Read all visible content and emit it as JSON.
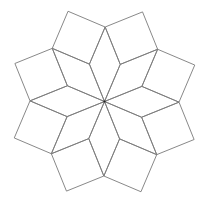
{
  "diagram": {
    "type": "eight-pointed-star-rhombus-tiling",
    "canvas": {
      "width": 208,
      "height": 202,
      "background": "#ffffff"
    },
    "center": {
      "x": 104.5,
      "y": 101.5
    },
    "star_tip_radius": 74.5,
    "rotation_deg": 0.5,
    "rhombus_count": 8,
    "rhombus_center_angle_deg": 45,
    "square_count": 8,
    "stroke_color": "#7a7a7a",
    "stroke_width": 0.9,
    "center_dot_color": "#222222"
  }
}
